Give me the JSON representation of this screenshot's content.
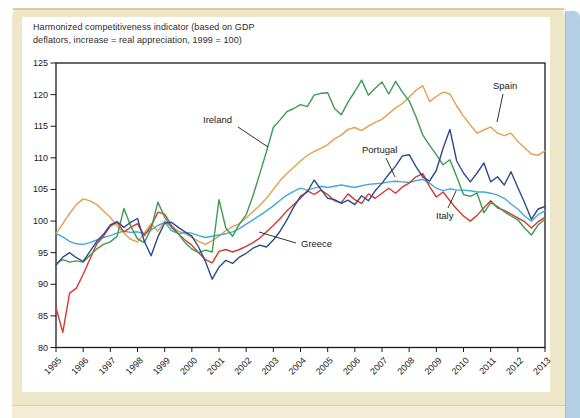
{
  "page": {
    "background": "#ffffff",
    "frame_color": "#EEE6C8",
    "frame_edge_color": "#D9CDA4",
    "book_edge_color": "#B3D0E4"
  },
  "figure": {
    "title_line1": "Harmonized competitiveness indicator (based on GDP",
    "title_line2": "deflators, increase = real appreciation, 1999 = 100)"
  },
  "chart_data": {
    "type": "line",
    "title": "Harmonized competitiveness indicator (based on GDP deflators, increase = real appreciation, 1999 = 100)",
    "grid": false,
    "legend_position": "inline-labels",
    "ylim": [
      80,
      125
    ],
    "y_ticks": [
      80,
      85,
      90,
      95,
      100,
      105,
      110,
      115,
      120,
      125
    ],
    "x_tick_labels": [
      "1995",
      "1996",
      "1997",
      "1998",
      "1999",
      "2000",
      "2001",
      "2002",
      "2003",
      "2004",
      "2005",
      "2006",
      "2007",
      "2008",
      "2009",
      "2010",
      "2011",
      "2012",
      "2013"
    ],
    "x_start_year": 1995,
    "x_end_year": 2013,
    "points_per_year": 4,
    "series": [
      {
        "name": "Spain",
        "color": "#E0A04F",
        "label_pos": [
          493,
          89
        ],
        "callout": [
          [
            503,
            94
          ],
          [
            497,
            122
          ]
        ],
        "values": [
          98.0,
          99.6,
          101.2,
          102.6,
          103.5,
          103.2,
          102.6,
          101.6,
          100.6,
          99.2,
          98.1,
          97.1,
          96.7,
          98.1,
          99.6,
          98.4,
          100.0,
          99.1,
          98.4,
          98.0,
          97.4,
          96.8,
          96.3,
          96.9,
          97.6,
          98.5,
          99.1,
          99.6,
          100.5,
          101.5,
          102.5,
          103.6,
          105.0,
          106.4,
          107.5,
          108.5,
          109.5,
          110.4,
          111.0,
          111.5,
          112.1,
          113.0,
          113.6,
          114.5,
          114.8,
          114.3,
          115.0,
          115.6,
          116.1,
          117.0,
          117.9,
          118.6,
          119.6,
          120.7,
          121.4,
          118.9,
          119.7,
          120.4,
          120.1,
          118.2,
          116.6,
          115.2,
          113.9,
          114.4,
          114.9,
          113.9,
          113.5,
          113.9,
          112.6,
          111.6,
          110.6,
          110.4,
          111.1
        ]
      },
      {
        "name": "Portugal",
        "color": "#44A8DB",
        "label_pos": [
          362,
          153
        ],
        "callout": [
          [
            386,
            158
          ],
          [
            395,
            177
          ]
        ],
        "values": [
          98.0,
          97.5,
          96.8,
          96.4,
          96.3,
          96.6,
          97.0,
          97.4,
          97.7,
          98.1,
          98.4,
          98.2,
          98.3,
          98.0,
          98.6,
          99.3,
          99.8,
          98.5,
          98.0,
          98.2,
          98.1,
          97.7,
          97.4,
          97.6,
          97.8,
          98.0,
          98.3,
          98.8,
          99.5,
          100.2,
          100.9,
          101.6,
          102.4,
          103.3,
          104.1,
          104.7,
          105.2,
          104.9,
          105.2,
          105.5,
          105.3,
          105.5,
          105.7,
          105.5,
          105.3,
          105.6,
          105.8,
          105.9,
          106.0,
          106.2,
          106.3,
          106.2,
          106.1,
          106.4,
          106.6,
          106.0,
          105.2,
          104.8,
          105.1,
          104.9,
          104.9,
          104.8,
          104.6,
          104.6,
          104.4,
          104.1,
          103.6,
          102.7,
          101.9,
          100.8,
          100.0,
          101.0,
          101.6
        ]
      },
      {
        "name": "Greece",
        "color": "#D23B30",
        "label_pos": [
          301,
          247
        ],
        "callout": [
          [
            296,
            243
          ],
          [
            259,
            232
          ]
        ],
        "values": [
          86.3,
          82.4,
          88.6,
          89.4,
          91.6,
          94.0,
          96.4,
          97.6,
          99.2,
          99.8,
          98.3,
          99.0,
          99.6,
          97.7,
          99.2,
          101.4,
          101.1,
          99.3,
          98.0,
          97.0,
          96.2,
          95.0,
          93.9,
          93.4,
          95.2,
          95.5,
          95.1,
          95.5,
          96.0,
          96.6,
          97.3,
          98.3,
          99.3,
          100.4,
          101.6,
          102.6,
          103.6,
          104.8,
          104.2,
          104.9,
          104.2,
          103.2,
          102.9,
          104.3,
          103.4,
          102.8,
          104.3,
          103.6,
          104.4,
          105.2,
          104.4,
          105.4,
          106.0,
          107.0,
          107.5,
          105.5,
          103.8,
          104.6,
          103.2,
          101.9,
          100.8,
          100.0,
          100.9,
          102.1,
          103.2,
          102.1,
          101.7,
          101.1,
          100.5,
          99.9,
          98.9,
          99.9,
          100.6
        ]
      },
      {
        "name": "Ireland",
        "color": "#3C9B52",
        "label_pos": [
          203,
          123
        ],
        "callout": [
          [
            238,
            127
          ],
          [
            268,
            147
          ]
        ],
        "values": [
          93.3,
          93.9,
          93.5,
          93.7,
          93.5,
          94.6,
          95.6,
          96.3,
          96.7,
          97.6,
          102.0,
          99.2,
          97.2,
          96.6,
          98.8,
          103.0,
          100.6,
          99.0,
          98.0,
          96.6,
          95.6,
          95.0,
          95.4,
          95.1,
          103.4,
          98.9,
          97.6,
          99.5,
          101.0,
          104.0,
          107.5,
          111.0,
          114.8,
          116.0,
          117.3,
          117.8,
          118.4,
          118.1,
          119.9,
          120.2,
          120.3,
          117.8,
          116.8,
          118.8,
          120.5,
          122.3,
          119.9,
          121.0,
          122.0,
          120.1,
          122.1,
          120.4,
          119.0,
          116.5,
          113.6,
          112.0,
          110.5,
          108.9,
          109.7,
          107.0,
          104.2,
          103.9,
          104.4,
          101.3,
          102.9,
          102.3,
          101.5,
          100.8,
          100.2,
          98.9,
          97.8,
          99.4,
          100.3
        ]
      },
      {
        "name": "Italy",
        "color": "#2C4B8F",
        "label_pos": [
          436,
          219
        ],
        "callout": [
          [
            448,
            208
          ],
          [
            456,
            191
          ]
        ],
        "values": [
          93.0,
          94.3,
          95.0,
          94.2,
          93.6,
          95.2,
          96.8,
          97.9,
          99.4,
          99.9,
          99.0,
          99.8,
          100.4,
          96.8,
          94.5,
          97.5,
          99.7,
          99.8,
          99.0,
          98.3,
          97.6,
          95.9,
          93.6,
          90.8,
          92.7,
          93.8,
          93.3,
          94.3,
          94.9,
          95.7,
          96.2,
          95.9,
          97.0,
          98.4,
          100.2,
          102.2,
          103.9,
          104.6,
          106.5,
          105.0,
          103.6,
          103.4,
          102.8,
          103.3,
          102.6,
          104.0,
          103.2,
          104.8,
          106.0,
          107.4,
          108.7,
          110.3,
          110.5,
          108.6,
          107.0,
          106.3,
          108.0,
          111.5,
          114.5,
          109.5,
          107.6,
          106.2,
          107.6,
          109.2,
          106.2,
          107.0,
          105.7,
          107.8,
          105.3,
          102.9,
          100.3,
          101.9,
          102.3
        ]
      }
    ]
  }
}
